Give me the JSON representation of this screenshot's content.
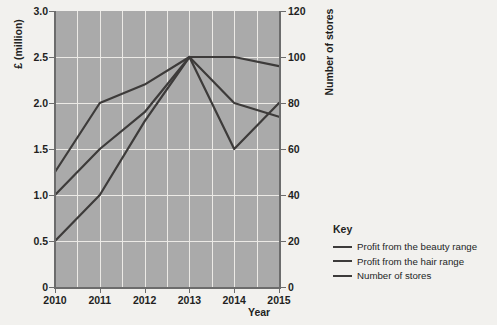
{
  "axes": {
    "y_left_title": "£ (million)",
    "y_right_title": "Number of stores",
    "x_title": "Year",
    "y_left_ticks": [
      "3.0",
      "2.5",
      "2.0",
      "1.5",
      "1.0",
      "0.5",
      "0"
    ],
    "y_right_ticks": [
      "120",
      "100",
      "80",
      "60",
      "40",
      "20",
      "0"
    ],
    "x_ticks": [
      "2010",
      "2011",
      "2012",
      "2013",
      "2014",
      "2015"
    ]
  },
  "legend": {
    "title": "Key",
    "items": [
      {
        "label": "Profit from the beauty range"
      },
      {
        "label": "Profit from the hair range"
      },
      {
        "label": "Number of stores"
      }
    ]
  },
  "colors": {
    "plot_background": "#aaaaaa",
    "gridline": "#eceae6",
    "series_line": "#3d3b3a",
    "axis": "#6c6c6c",
    "page_background": "#f2f1ee",
    "text": "#231f1e"
  },
  "chart_data": {
    "type": "line",
    "title": "",
    "xlabel": "Year",
    "ylabel": "£ (million)",
    "y2label": "Number of stores",
    "x": [
      "2010",
      "2011",
      "2012",
      "2013",
      "2014",
      "2015"
    ],
    "ylim": [
      0,
      3.0
    ],
    "y2lim": [
      0,
      120
    ],
    "y_ticks": [
      0,
      0.5,
      1.0,
      1.5,
      2.0,
      2.5,
      3.0
    ],
    "y2_ticks": [
      0,
      20,
      40,
      60,
      80,
      100,
      120
    ],
    "grid": true,
    "legend_position": "right",
    "series": [
      {
        "name": "Profit from the beauty range",
        "axis": "left",
        "units": "£ million",
        "values": [
          1.25,
          2.0,
          2.2,
          2.5,
          2.0,
          1.85
        ]
      },
      {
        "name": "Profit from the hair range",
        "axis": "left",
        "units": "£ million",
        "values": [
          0.5,
          1.0,
          1.8,
          2.5,
          1.5,
          2.0
        ]
      },
      {
        "name": "Number of stores",
        "axis": "right",
        "units": "stores",
        "values": [
          40,
          60,
          76,
          100,
          100,
          96
        ]
      }
    ]
  }
}
